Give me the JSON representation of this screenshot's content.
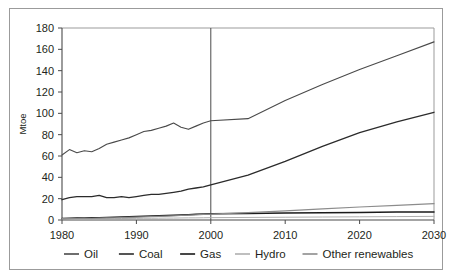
{
  "figure": {
    "clipped_title_fragment": "",
    "frame_color": "#9b9b9b",
    "background": "#ffffff"
  },
  "chart_data": {
    "type": "line",
    "title": "",
    "subtitle": "",
    "xlabel": "",
    "ylabel": "Mtoe",
    "xlim": [
      1980,
      2030
    ],
    "ylim": [
      0,
      180
    ],
    "ytick_step": 20,
    "xtick_step": 10,
    "xticks": [
      1980,
      1990,
      2000,
      2010,
      2020,
      2030
    ],
    "xtick_labels": [
      "1980",
      "1990",
      "2000",
      "2010",
      "2020",
      "2030"
    ],
    "yticks": [
      0,
      20,
      40,
      60,
      80,
      100,
      120,
      140,
      160,
      180
    ],
    "ytick_labels": [
      "0",
      "20",
      "40",
      "60",
      "80",
      "100",
      "120",
      "140",
      "160",
      "180"
    ],
    "grid": false,
    "legend_position": "bottom",
    "annotations": [
      {
        "name": "history-projection-divider",
        "type": "vline",
        "x": 2000,
        "label": ""
      }
    ],
    "x": [
      1980,
      1981,
      1982,
      1983,
      1984,
      1985,
      1986,
      1987,
      1988,
      1989,
      1990,
      1991,
      1992,
      1993,
      1994,
      1995,
      1996,
      1997,
      1998,
      1999,
      2000,
      2005,
      2010,
      2015,
      2020,
      2025,
      2030
    ],
    "series": [
      {
        "name": "Oil",
        "color": "#4a4a4a",
        "width": 1.1,
        "values": [
          61,
          66,
          63,
          65,
          64,
          67,
          71,
          73,
          75,
          77,
          80,
          83,
          84,
          86,
          88,
          91,
          87,
          85,
          88,
          91,
          93,
          95,
          112,
          127,
          141,
          154,
          167
        ]
      },
      {
        "name": "Coal",
        "color": "#2b2b2b",
        "width": 1.3,
        "values": [
          19,
          21,
          22,
          22,
          22,
          23,
          21,
          21,
          22,
          21,
          22,
          23,
          24,
          24,
          25,
          26,
          27,
          29,
          30,
          31,
          33,
          42,
          55,
          69,
          82,
          92,
          101
        ]
      },
      {
        "name": "Gas",
        "color": "#1a1a1a",
        "width": 1.5,
        "values": [
          1.5,
          1.6,
          1.8,
          1.9,
          2.0,
          2.2,
          2.4,
          2.6,
          2.8,
          3.0,
          3.2,
          3.5,
          3.8,
          4.0,
          4.2,
          4.5,
          4.8,
          5.0,
          5.3,
          5.6,
          5.9,
          6.2,
          6.6,
          6.9,
          7.1,
          7.4,
          7.6
        ]
      },
      {
        "name": "Hydro",
        "color": "#b0b0b0",
        "width": 1.0,
        "values": [
          1.0,
          1.0,
          1.1,
          1.1,
          1.2,
          1.2,
          1.3,
          1.3,
          1.4,
          1.4,
          1.5,
          1.6,
          1.6,
          1.7,
          1.8,
          1.8,
          1.9,
          2.0,
          2.0,
          2.1,
          2.2,
          2.4,
          2.6,
          2.8,
          3.0,
          3.2,
          3.4
        ]
      },
      {
        "name": "Other renewables",
        "color": "#8c8c8c",
        "width": 1.2,
        "values": [
          1.2,
          1.3,
          1.4,
          1.5,
          1.6,
          1.8,
          1.9,
          2.1,
          2.3,
          2.5,
          2.7,
          2.9,
          3.1,
          3.4,
          3.6,
          3.9,
          4.2,
          4.5,
          4.8,
          5.2,
          5.6,
          7.0,
          8.6,
          10.4,
          12.2,
          13.8,
          15.3
        ]
      }
    ]
  },
  "legend": {
    "items": [
      {
        "label": "Oil",
        "color": "#4a4a4a"
      },
      {
        "label": "Coal",
        "color": "#2b2b2b"
      },
      {
        "label": "Gas",
        "color": "#1a1a1a"
      },
      {
        "label": "Hydro",
        "color": "#b0b0b0"
      },
      {
        "label": "Other renewables",
        "color": "#8c8c8c"
      }
    ]
  }
}
